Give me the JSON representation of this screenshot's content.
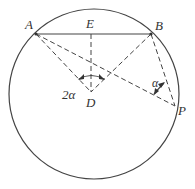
{
  "diagram": {
    "circle": {
      "cx": 94,
      "cy": 94,
      "r": 85
    },
    "points": {
      "A": {
        "label": "A",
        "x": 36,
        "y": 34
      },
      "B": {
        "label": "B",
        "x": 151,
        "y": 34
      },
      "E": {
        "label": "E",
        "x": 91,
        "y": 34
      },
      "D": {
        "label": "D",
        "x": 91,
        "y": 92
      },
      "P": {
        "label": "P",
        "x": 175,
        "y": 106
      }
    },
    "angles": {
      "central": {
        "label": "2α",
        "vertex": "D"
      },
      "inscribed": {
        "label": "α",
        "vertex": "P"
      }
    },
    "segments": {
      "solid": [
        "AB"
      ],
      "dashed": [
        "AD",
        "BD",
        "ED",
        "AP",
        "BP"
      ]
    }
  }
}
